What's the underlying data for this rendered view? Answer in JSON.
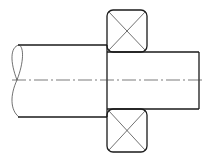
{
  "diagram": {
    "type": "technical-drawing",
    "colors": {
      "line": "#1a1a1a",
      "background": "#ffffff"
    },
    "shaft": {
      "large_section": {
        "x1": 17,
        "x2": 107,
        "y_top": 45,
        "y_bottom": 117
      },
      "small_section": {
        "x1": 107,
        "x2": 199,
        "y_top": 52,
        "y_bottom": 109
      },
      "break_line": "left-end-conventional-break"
    },
    "bearings": [
      {
        "position": "top",
        "x": 107,
        "y": 10,
        "width": 40,
        "height": 42,
        "symbol": "cross"
      },
      {
        "position": "bottom",
        "x": 107,
        "y": 109,
        "width": 40,
        "height": 43,
        "symbol": "cross"
      }
    ],
    "centerline": {
      "y": 80,
      "x1": 12,
      "x2": 203,
      "style": "dash-dot"
    }
  }
}
